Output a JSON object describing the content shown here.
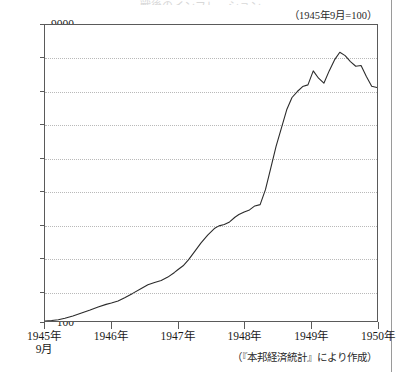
{
  "page": {
    "title_sliver": "戦後のインフレーション",
    "unit_note": "（1945年9月=100）",
    "source_note": "（『本邦経済統計』により作成）",
    "border_color": "#5a5a5a",
    "grid_color": "#b9b9b9",
    "line_color": "#2b2b2b"
  },
  "chart_data": {
    "type": "line",
    "title": "戦後のインフレーション",
    "subtitle": "（1945年9月=100）",
    "xlabel": "",
    "ylabel": "",
    "ylim": [
      100,
      9000
    ],
    "xlim": [
      0,
      5
    ],
    "grid": true,
    "legend": "none",
    "annotations": [
      "（1945年9月=100）",
      "（『本邦経済統計』により作成）"
    ],
    "y_ticks": [
      100,
      1000,
      2000,
      3000,
      4000,
      5000,
      6000,
      7000,
      8000,
      9000
    ],
    "y_tick_labels": [
      "100",
      "1000",
      "2000",
      "3000",
      "4000",
      "5000",
      "6000",
      "7000",
      "8000",
      "9000"
    ],
    "x_ticks": [
      0,
      1,
      2,
      3,
      4,
      5
    ],
    "x_tick_labels": [
      "1945年",
      "1946年",
      "1947年",
      "1948年",
      "1949年",
      "1950年"
    ],
    "x_tick_sublabels": [
      "9月",
      "",
      "",
      "",
      "",
      ""
    ],
    "series": [
      {
        "name": "物価指数",
        "x": [
          0.0,
          0.1,
          0.2,
          0.3,
          0.42,
          0.55,
          0.68,
          0.8,
          0.92,
          1.0,
          1.1,
          1.2,
          1.32,
          1.45,
          1.55,
          1.65,
          1.75,
          1.85,
          1.95,
          2.0,
          2.08,
          2.16,
          2.25,
          2.35,
          2.45,
          2.55,
          2.62,
          2.7,
          2.78,
          2.86,
          2.92,
          3.0,
          3.08,
          3.16,
          3.24,
          3.32,
          3.4,
          3.48,
          3.56,
          3.64,
          3.72,
          3.8,
          3.88,
          3.96,
          4.04,
          4.12,
          4.2,
          4.28,
          4.36,
          4.44,
          4.52,
          4.6,
          4.68,
          4.76,
          4.84,
          4.92,
          5.0
        ],
        "values": [
          100,
          115,
          140,
          180,
          250,
          340,
          430,
          520,
          600,
          640,
          700,
          800,
          930,
          1080,
          1190,
          1260,
          1320,
          1420,
          1560,
          1640,
          1760,
          1940,
          2180,
          2450,
          2680,
          2880,
          2960,
          3000,
          3080,
          3220,
          3300,
          3380,
          3440,
          3560,
          3600,
          4050,
          4700,
          5350,
          5900,
          6450,
          6820,
          7000,
          7150,
          7200,
          7620,
          7400,
          7250,
          7620,
          7950,
          8180,
          8080,
          7900,
          7760,
          7780,
          7450,
          7160,
          7120
        ]
      }
    ]
  }
}
